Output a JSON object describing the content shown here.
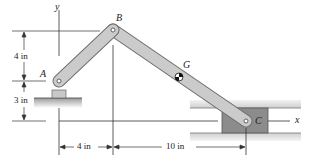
{
  "figure": {
    "points": {
      "A": "A",
      "B": "B",
      "C": "C",
      "G": "G"
    },
    "axes": {
      "x": "x",
      "y": "y"
    },
    "dimensions": {
      "vertical_upper": "4 in",
      "vertical_lower": "3 in",
      "horizontal_left": "4 in",
      "horizontal_right": "10 in"
    },
    "colors": {
      "link_fill": "#c8c8c8",
      "link_stroke": "#6e6e6e",
      "block_fill": "#8c8c8c",
      "slot_fill": "#d9d9d9",
      "line": "#333333"
    }
  }
}
